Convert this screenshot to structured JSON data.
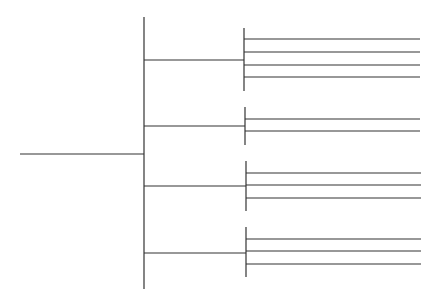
{
  "diagram": {
    "type": "tree-bracket",
    "orientation": "left-to-right",
    "line_color": "#333333",
    "background": "#ffffff",
    "root": {
      "x1": 20,
      "x2": 144,
      "y": 154
    },
    "trunk": {
      "x": 144,
      "y1": 17,
      "y2": 289
    },
    "branches": [
      {
        "y": 60,
        "x2": 244,
        "bar": {
          "x": 244,
          "y1": 28,
          "y2": 91
        },
        "leaves": [
          39,
          52,
          65,
          77
        ],
        "leaf_end": 420
      },
      {
        "y": 126,
        "x2": 245,
        "bar": {
          "x": 245,
          "y1": 107,
          "y2": 145
        },
        "leaves": [
          119,
          131
        ],
        "leaf_end": 420
      },
      {
        "y": 186,
        "x2": 246,
        "bar": {
          "x": 246,
          "y1": 161,
          "y2": 211
        },
        "leaves": [
          173,
          185,
          198
        ],
        "leaf_end": 421
      },
      {
        "y": 253,
        "x2": 246,
        "bar": {
          "x": 246,
          "y1": 227,
          "y2": 277
        },
        "leaves": [
          239,
          251,
          264
        ],
        "leaf_end": 421
      }
    ]
  }
}
